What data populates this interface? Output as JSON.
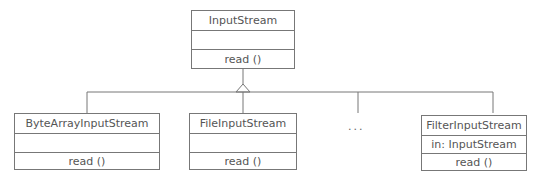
{
  "diagram": {
    "type": "uml-class-inheritance",
    "parent": {
      "name": "InputStream",
      "attributes": "",
      "operations": "read ()"
    },
    "children": [
      {
        "name": "ByteArrayInputStream",
        "attributes": "",
        "operations": "read ()"
      },
      {
        "name": "FileInputStream",
        "attributes": "",
        "operations": "read ()"
      },
      {
        "name": "FilterInputStream",
        "attributes": "in: InputStream",
        "operations": "read ()"
      }
    ],
    "ellipsis": "..."
  },
  "colors": {
    "line": "#777777",
    "text": "#555555",
    "background": "#ffffff"
  }
}
